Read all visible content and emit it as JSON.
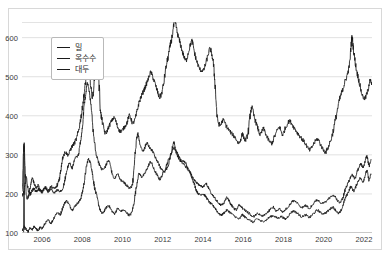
{
  "chart_data": {
    "type": "line",
    "title": "",
    "xlabel": "",
    "ylabel": "",
    "xlim": [
      2005.0,
      2022.4
    ],
    "ylim": [
      100,
      640
    ],
    "grid": true,
    "legend_position": "upper-left",
    "xticks": [
      "2006",
      "2008",
      "2010",
      "2012",
      "2014",
      "2016",
      "2018",
      "2020",
      "2022"
    ],
    "xtick_values": [
      2006,
      2008,
      2010,
      2012,
      2014,
      2016,
      2018,
      2020,
      2022
    ],
    "yticks": [
      "100",
      "200",
      "300",
      "400",
      "500",
      "600"
    ],
    "ytick_values": [
      100,
      200,
      300,
      400,
      500,
      600
    ],
    "series": [
      {
        "name": "밀",
        "color": "#1a1a1a",
        "x": [
          2005.0,
          2005.1,
          2005.2,
          2005.3,
          2005.4,
          2005.5,
          2005.6,
          2005.7,
          2005.8,
          2005.9,
          2006.0,
          2006.15,
          2006.3,
          2006.45,
          2006.6,
          2006.75,
          2006.9,
          2007.05,
          2007.2,
          2007.35,
          2007.5,
          2007.65,
          2007.8,
          2007.9,
          2008.0,
          2008.08,
          2008.16,
          2008.25,
          2008.35,
          2008.45,
          2008.55,
          2008.7,
          2008.85,
          2009.0,
          2009.15,
          2009.3,
          2009.45,
          2009.6,
          2009.75,
          2009.9,
          2010.05,
          2010.2,
          2010.35,
          2010.5,
          2010.62,
          2010.75,
          2010.9,
          2011.05,
          2011.2,
          2011.35,
          2011.5,
          2011.65,
          2011.8,
          2011.95,
          2012.1,
          2012.25,
          2012.4,
          2012.55,
          2012.65,
          2012.8,
          2012.95,
          2013.1,
          2013.25,
          2013.4,
          2013.55,
          2013.7,
          2013.85,
          2014.0,
          2014.15,
          2014.3,
          2014.45,
          2014.6,
          2014.75,
          2014.9,
          2015.05,
          2015.2,
          2015.35,
          2015.5,
          2015.65,
          2015.8,
          2015.95,
          2016.1,
          2016.3,
          2016.5,
          2016.7,
          2016.9,
          2017.1,
          2017.3,
          2017.5,
          2017.65,
          2017.8,
          2017.95,
          2018.1,
          2018.3,
          2018.5,
          2018.7,
          2018.9,
          2019.1,
          2019.3,
          2019.5,
          2019.7,
          2019.9,
          2020.1,
          2020.3,
          2020.5,
          2020.65,
          2020.8,
          2020.95,
          2021.1,
          2021.25,
          2021.4,
          2021.55,
          2021.7,
          2021.85,
          2021.95,
          2022.05,
          2022.15,
          2022.25,
          2022.35
        ],
        "y": [
          198,
          322,
          205,
          192,
          215,
          238,
          228,
          216,
          222,
          210,
          208,
          214,
          206,
          212,
          204,
          210,
          206,
          218,
          252,
          278,
          268,
          292,
          300,
          330,
          368,
          420,
          452,
          482,
          458,
          418,
          352,
          300,
          276,
          262,
          270,
          286,
          258,
          240,
          252,
          236,
          230,
          222,
          216,
          228,
          300,
          352,
          320,
          312,
          330,
          318,
          308,
          292,
          276,
          262,
          258,
          272,
          300,
          330,
          312,
          296,
          284,
          282,
          266,
          250,
          236,
          228,
          222,
          218,
          226,
          212,
          198,
          188,
          178,
          172,
          178,
          190,
          176,
          166,
          160,
          172,
          164,
          158,
          150,
          142,
          150,
          144,
          148,
          158,
          166,
          156,
          162,
          154,
          160,
          172,
          182,
          176,
          166,
          170,
          164,
          176,
          184,
          176,
          180,
          190,
          196,
          186,
          178,
          190,
          216,
          232,
          250,
          240,
          262,
          276,
          268,
          282,
          296,
          272,
          288
        ]
      },
      {
        "name": "옥수수",
        "color": "#1a1a1a",
        "x": [
          2005.0,
          2005.1,
          2005.2,
          2005.3,
          2005.4,
          2005.5,
          2005.6,
          2005.7,
          2005.8,
          2005.9,
          2006.0,
          2006.15,
          2006.3,
          2006.45,
          2006.6,
          2006.75,
          2006.9,
          2007.05,
          2007.2,
          2007.35,
          2007.5,
          2007.65,
          2007.8,
          2007.9,
          2008.0,
          2008.1,
          2008.2,
          2008.3,
          2008.42,
          2008.5,
          2008.6,
          2008.75,
          2008.9,
          2009.0,
          2009.15,
          2009.3,
          2009.45,
          2009.6,
          2009.75,
          2009.9,
          2010.05,
          2010.2,
          2010.35,
          2010.5,
          2010.65,
          2010.8,
          2010.95,
          2011.1,
          2011.25,
          2011.4,
          2011.55,
          2011.7,
          2011.85,
          2012.0,
          2012.2,
          2012.4,
          2012.55,
          2012.7,
          2012.85,
          2013.0,
          2013.2,
          2013.4,
          2013.55,
          2013.7,
          2013.85,
          2014.0,
          2014.15,
          2014.3,
          2014.45,
          2014.6,
          2014.75,
          2014.9,
          2015.05,
          2015.2,
          2015.4,
          2015.6,
          2015.8,
          2015.95,
          2016.1,
          2016.3,
          2016.5,
          2016.7,
          2016.9,
          2017.1,
          2017.3,
          2017.5,
          2017.7,
          2017.9,
          2018.1,
          2018.3,
          2018.5,
          2018.7,
          2018.9,
          2019.1,
          2019.3,
          2019.5,
          2019.7,
          2019.9,
          2020.1,
          2020.3,
          2020.45,
          2020.6,
          2020.75,
          2020.9,
          2021.05,
          2021.2,
          2021.35,
          2021.5,
          2021.65,
          2021.8,
          2021.95,
          2022.05,
          2022.15,
          2022.25,
          2022.35
        ],
        "y": [
          106,
          116,
          110,
          104,
          112,
          108,
          116,
          112,
          106,
          114,
          112,
          124,
          132,
          126,
          140,
          152,
          148,
          168,
          182,
          172,
          160,
          170,
          178,
          186,
          204,
          232,
          268,
          288,
          276,
          252,
          218,
          186,
          158,
          150,
          162,
          170,
          158,
          150,
          162,
          156,
          158,
          152,
          146,
          160,
          206,
          250,
          244,
          252,
          268,
          282,
          264,
          250,
          238,
          252,
          276,
          300,
          318,
          302,
          286,
          278,
          266,
          250,
          228,
          206,
          198,
          200,
          192,
          180,
          172,
          164,
          152,
          146,
          152,
          158,
          150,
          142,
          136,
          146,
          140,
          134,
          128,
          136,
          130,
          132,
          140,
          144,
          138,
          142,
          136,
          148,
          156,
          150,
          142,
          146,
          140,
          150,
          158,
          150,
          152,
          160,
          166,
          158,
          150,
          162,
          186,
          202,
          218,
          208,
          226,
          240,
          232,
          246,
          258,
          236,
          250
        ]
      },
      {
        "name": "대두",
        "color": "#1a1a1a",
        "x": [
          2005.0,
          2005.1,
          2005.2,
          2005.3,
          2005.4,
          2005.5,
          2005.6,
          2005.7,
          2005.8,
          2005.9,
          2006.0,
          2006.15,
          2006.3,
          2006.45,
          2006.6,
          2006.75,
          2006.9,
          2007.0,
          2007.15,
          2007.3,
          2007.45,
          2007.6,
          2007.75,
          2007.9,
          2008.0,
          2008.1,
          2008.2,
          2008.3,
          2008.4,
          2008.5,
          2008.62,
          2008.75,
          2008.9,
          2009.0,
          2009.15,
          2009.3,
          2009.45,
          2009.6,
          2009.75,
          2009.9,
          2010.05,
          2010.2,
          2010.35,
          2010.5,
          2010.65,
          2010.8,
          2010.95,
          2011.1,
          2011.25,
          2011.4,
          2011.55,
          2011.7,
          2011.85,
          2012.0,
          2012.15,
          2012.3,
          2012.45,
          2012.6,
          2012.72,
          2012.85,
          2013.0,
          2013.15,
          2013.3,
          2013.45,
          2013.6,
          2013.75,
          2013.9,
          2014.05,
          2014.2,
          2014.35,
          2014.5,
          2014.6,
          2014.7,
          2014.85,
          2015.0,
          2015.2,
          2015.4,
          2015.6,
          2015.8,
          2015.95,
          2016.1,
          2016.25,
          2016.4,
          2016.55,
          2016.7,
          2016.85,
          2017.0,
          2017.2,
          2017.4,
          2017.6,
          2017.8,
          2017.95,
          2018.1,
          2018.3,
          2018.5,
          2018.7,
          2018.9,
          2019.1,
          2019.3,
          2019.5,
          2019.7,
          2019.9,
          2020.1,
          2020.3,
          2020.5,
          2020.7,
          2020.85,
          2020.95,
          2021.05,
          2021.2,
          2021.3,
          2021.4,
          2021.5,
          2021.62,
          2021.75,
          2021.9,
          2022.05,
          2022.2,
          2022.3,
          2022.4
        ],
        "y": [
          196,
          206,
          240,
          212,
          200,
          208,
          214,
          206,
          212,
          208,
          206,
          216,
          210,
          218,
          214,
          222,
          250,
          288,
          306,
          300,
          318,
          330,
          348,
          386,
          420,
          460,
          500,
          520,
          486,
          448,
          500,
          540,
          420,
          382,
          356,
          370,
          386,
          394,
          372,
          360,
          368,
          380,
          400,
          382,
          396,
          430,
          452,
          470,
          490,
          510,
          492,
          468,
          448,
          470,
          520,
          560,
          600,
          640,
          612,
          588,
          560,
          542,
          568,
          590,
          556,
          530,
          516,
          520,
          546,
          570,
          540,
          480,
          398,
          376,
          388,
          370,
          356,
          344,
          330,
          352,
          338,
          360,
          420,
          396,
          372,
          352,
          366,
          344,
          330,
          352,
          370,
          352,
          370,
          386,
          372,
          356,
          342,
          328,
          312,
          328,
          340,
          320,
          308,
          330,
          368,
          420,
          452,
          468,
          486,
          510,
          540,
          598,
          560,
          520,
          490,
          456,
          444,
          466,
          490,
          480
        ]
      }
    ]
  },
  "legend": {
    "items": [
      {
        "label": "밀"
      },
      {
        "label": "옥수수"
      },
      {
        "label": "대두"
      }
    ]
  },
  "axes": {
    "x_tick_labels": [
      "2006",
      "2008",
      "2010",
      "2012",
      "2014",
      "2016",
      "2018",
      "2020",
      "2022"
    ],
    "y_tick_labels": [
      "100",
      "200",
      "300",
      "400",
      "500",
      "600"
    ]
  },
  "colors": {
    "line": "#1a1a1a",
    "grid": "#d9d9d9",
    "frame": "#d8d8d8",
    "tick_text": "#3a3a3a",
    "background": "#ffffff"
  }
}
